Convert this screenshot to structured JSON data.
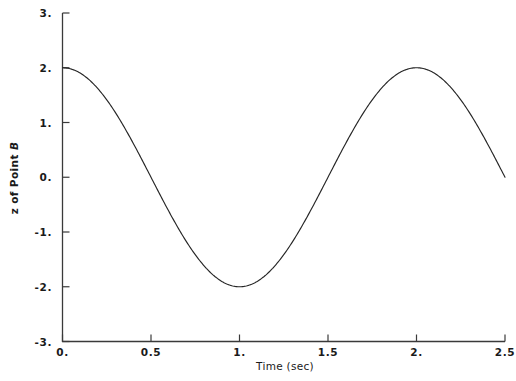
{
  "chart_data": {
    "type": "line",
    "title": "",
    "xlabel": "Time (sec)",
    "ylabel": "z of Point B",
    "ylabel_parts": {
      "text": "z of Point ",
      "emphasis": "B"
    },
    "xlim": [
      0,
      2.5
    ],
    "ylim": [
      -3,
      3
    ],
    "grid": false,
    "legend": null,
    "xticks": [
      0,
      0.5,
      1,
      1.5,
      2,
      2.5
    ],
    "xtick_labels": [
      "0.",
      "0.5",
      "1.",
      "1.5",
      "2.",
      "2.5"
    ],
    "yticks": [
      3,
      2,
      1,
      0,
      -1,
      -2,
      -3
    ],
    "ytick_labels": [
      "3.",
      "2.",
      "1.",
      "0.",
      "-1.",
      "-2.",
      "-3."
    ],
    "line_color": "#262626",
    "line_width": 1,
    "axis_color": "#3a3a3a",
    "background_color": "#ffffff",
    "series": [
      {
        "name": "z of Point B",
        "formula": "z = 2*cos(pi*t)",
        "amplitude": 2,
        "period_sec": 2,
        "x": [
          0,
          0.05,
          0.1,
          0.15,
          0.2,
          0.25,
          0.3,
          0.35,
          0.4,
          0.45,
          0.5,
          0.55,
          0.6,
          0.65,
          0.7,
          0.75,
          0.8,
          0.85,
          0.9,
          0.95,
          1,
          1.05,
          1.1,
          1.15,
          1.2,
          1.25,
          1.3,
          1.35,
          1.4,
          1.45,
          1.5,
          1.55,
          1.6,
          1.65,
          1.7,
          1.75,
          1.8,
          1.85,
          1.9,
          1.95,
          2,
          2.05,
          2.1,
          2.15,
          2.2,
          2.25,
          2.3,
          2.35,
          2.4,
          2.45,
          2.5
        ],
        "y": [
          2,
          1.975,
          1.902,
          1.782,
          1.618,
          1.414,
          1.176,
          0.908,
          0.618,
          0.313,
          0,
          -0.313,
          -0.618,
          -0.908,
          -1.176,
          -1.414,
          -1.618,
          -1.782,
          -1.902,
          -1.975,
          -2,
          -1.975,
          -1.902,
          -1.782,
          -1.618,
          -1.414,
          -1.176,
          -0.908,
          -0.618,
          -0.313,
          0,
          0.313,
          0.618,
          0.908,
          1.176,
          1.414,
          1.618,
          1.782,
          1.902,
          1.975,
          2,
          1.975,
          1.902,
          1.782,
          1.618,
          1.414,
          1.176,
          0.908,
          0.618,
          0.313,
          0
        ]
      }
    ],
    "key_points": {
      "start": {
        "t": 0,
        "z": 2
      },
      "first_zero": {
        "t": 0.5,
        "z": 0
      },
      "minimum": {
        "t": 1,
        "z": -2
      },
      "second_zero": {
        "t": 1.5,
        "z": 0
      },
      "maximum": {
        "t": 2,
        "z": 2
      },
      "end": {
        "t": 2.5,
        "z": 0
      }
    }
  }
}
